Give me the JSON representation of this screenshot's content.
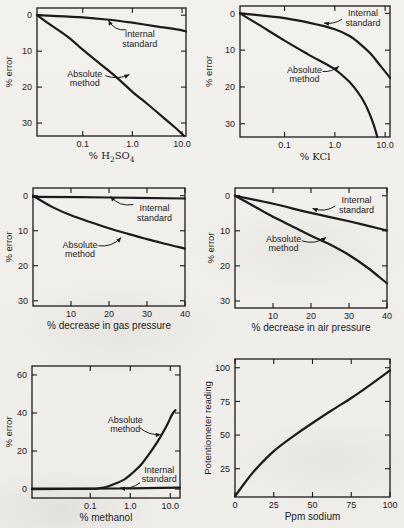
{
  "page": {
    "ink": "#1b1b1b",
    "paper": "#f1efec"
  },
  "chart_data": [
    {
      "id": "h2so4-error",
      "type": "line",
      "xscale": "log",
      "xlim": [
        0.012,
        12
      ],
      "ylim": [
        -2,
        33.6
      ],
      "y_down": true,
      "grid": false,
      "legend": "none",
      "xticks": [
        0.1,
        1.0,
        10.0
      ],
      "xtick_labels": [
        "0.1",
        "1.0",
        "10.0"
      ],
      "yticks": [
        0,
        10,
        20,
        30
      ],
      "ytick_labels": [
        "0",
        "10",
        "20",
        "30"
      ],
      "xlabel": "% H2SO4",
      "xlabel_parts": [
        [
          "% H",
          false
        ],
        [
          "2",
          true
        ],
        [
          "SO",
          false
        ],
        [
          "4",
          true
        ]
      ],
      "xlabel_serif": true,
      "ylabel": "% error",
      "box": {
        "l": 37,
        "t": 8,
        "r": 186,
        "b": 136
      },
      "ylabel_x": 12,
      "series": [
        {
          "name": "Internal standard",
          "points": [
            [
              0.012,
              0
            ],
            [
              0.03,
              0.25
            ],
            [
              0.1,
              0.6
            ],
            [
              0.3,
              1.2
            ],
            [
              1,
              2.1
            ],
            [
              3,
              3.1
            ],
            [
              10,
              4.2
            ],
            [
              12,
              4.6
            ]
          ]
        },
        {
          "name": "Absolute method",
          "points": [
            [
              0.012,
              0
            ],
            [
              0.02,
              2.2
            ],
            [
              0.05,
              6
            ],
            [
              0.1,
              9.6
            ],
            [
              0.2,
              13
            ],
            [
              0.5,
              17.5
            ],
            [
              1,
              21.3
            ],
            [
              2,
              24.7
            ],
            [
              4,
              28.2
            ],
            [
              8,
              31.8
            ],
            [
              11,
              33.6
            ]
          ]
        }
      ],
      "annotations": [
        {
          "lines": [
            "Internal",
            "standard"
          ],
          "tx": 0.69,
          "ty": 0.24,
          "sx": 0.6,
          "sy": 0.17,
          "ax": 0.48,
          "ay": 0.095,
          "bend": -0.35
        },
        {
          "lines": [
            "Absolute",
            "method"
          ],
          "tx": 0.32,
          "ty": 0.55,
          "sx": 0.46,
          "sy": 0.53,
          "ax": 0.62,
          "ay": 0.52,
          "bend": 0.2
        }
      ]
    },
    {
      "id": "kcl-error",
      "type": "line",
      "xscale": "log",
      "xlim": [
        0.013,
        12.5
      ],
      "ylim": [
        -2,
        33.6
      ],
      "y_down": true,
      "grid": false,
      "legend": "none",
      "xticks": [
        0.1,
        1.0,
        10.0
      ],
      "xtick_labels": [
        "0.1",
        "1.0",
        "10.0"
      ],
      "yticks": [
        0,
        10,
        20,
        30
      ],
      "ytick_labels": [
        "0",
        "10",
        "20",
        "30"
      ],
      "xlabel": "% KCl",
      "xlabel_parts": [
        [
          "% KCl",
          false
        ]
      ],
      "xlabel_serif": true,
      "ylabel": "% error",
      "box": {
        "l": 38,
        "t": 6,
        "r": 188,
        "b": 137
      },
      "ylabel_x": 10,
      "series": [
        {
          "name": "Internal standard",
          "points": [
            [
              0.013,
              0
            ],
            [
              0.05,
              0.8
            ],
            [
              0.1,
              1.3
            ],
            [
              0.3,
              2.5
            ],
            [
              1,
              4.3
            ],
            [
              2,
              6.2
            ],
            [
              3,
              8
            ],
            [
              5,
              10.8
            ],
            [
              8,
              14.2
            ],
            [
              12.5,
              17.5
            ]
          ]
        },
        {
          "name": "Absolute method",
          "points": [
            [
              0.013,
              0
            ],
            [
              0.03,
              3
            ],
            [
              0.1,
              7.4
            ],
            [
              0.3,
              11.2
            ],
            [
              1,
              15.2
            ],
            [
              2,
              18.8
            ],
            [
              3,
              21.8
            ],
            [
              4,
              24.6
            ],
            [
              5,
              27.6
            ],
            [
              6,
              30.5
            ],
            [
              7,
              33.6
            ]
          ]
        }
      ],
      "annotations": [
        {
          "lines": [
            "Internal",
            "standard"
          ],
          "tx": 0.82,
          "ty": 0.09,
          "sx": 0.68,
          "sy": 0.1,
          "ax": 0.56,
          "ay": 0.13,
          "bend": -0.2
        },
        {
          "lines": [
            "Absolute",
            "method"
          ],
          "tx": 0.43,
          "ty": 0.52,
          "sx": 0.55,
          "sy": 0.5,
          "ax": 0.66,
          "ay": 0.46,
          "bend": 0.2
        }
      ]
    },
    {
      "id": "gas-pressure-error",
      "type": "line",
      "xscale": "linear",
      "xlim": [
        0,
        40
      ],
      "ylim": [
        -2.2,
        31.5
      ],
      "y_down": true,
      "grid": false,
      "legend": "none",
      "xticks": [
        10,
        20,
        30,
        40
      ],
      "xtick_labels": [
        "10",
        "20",
        "30",
        "40"
      ],
      "yticks": [
        0,
        10,
        20,
        30
      ],
      "ytick_labels": [
        "0",
        "10",
        "20",
        "30"
      ],
      "xlabel": "% decrease in gas pressure",
      "xlabel_parts": [
        [
          "% decrease in gas pressure",
          false
        ]
      ],
      "xlabel_serif": false,
      "ylabel": "% error",
      "box": {
        "l": 33,
        "t": 12,
        "r": 185,
        "b": 130
      },
      "ylabel_x": 12,
      "series": [
        {
          "name": "Internal standard",
          "points": [
            [
              0,
              0.3
            ],
            [
              20,
              0.5
            ],
            [
              40,
              0.8
            ]
          ]
        },
        {
          "name": "Absolute method",
          "points": [
            [
              0,
              0
            ],
            [
              5,
              3.2
            ],
            [
              10,
              5.6
            ],
            [
              15,
              7.5
            ],
            [
              20,
              9.3
            ],
            [
              25,
              10.9
            ],
            [
              30,
              12.4
            ],
            [
              35,
              13.8
            ],
            [
              40,
              15.1
            ]
          ]
        }
      ],
      "annotations": [
        {
          "lines": [
            "Internal",
            "standard"
          ],
          "tx": 0.8,
          "ty": 0.21,
          "sx": 0.66,
          "sy": 0.14,
          "ax": 0.51,
          "ay": 0.07,
          "bend": -0.3
        },
        {
          "lines": [
            "Absolute",
            "method"
          ],
          "tx": 0.31,
          "ty": 0.52,
          "sx": 0.43,
          "sy": 0.49,
          "ax": 0.58,
          "ay": 0.42,
          "bend": 0.25
        }
      ]
    },
    {
      "id": "air-pressure-error",
      "type": "line",
      "xscale": "linear",
      "xlim": [
        0,
        40
      ],
      "ylim": [
        -2.2,
        32
      ],
      "y_down": true,
      "grid": false,
      "legend": "none",
      "xticks": [
        10,
        20,
        30,
        40
      ],
      "xtick_labels": [
        "10",
        "20",
        "30",
        "40"
      ],
      "yticks": [
        0,
        10,
        20,
        30
      ],
      "ytick_labels": [
        "0",
        "10",
        "20",
        "30"
      ],
      "xlabel": "% decrease in air pressure",
      "xlabel_parts": [
        [
          "% decrease in air pressure",
          false
        ]
      ],
      "xlabel_serif": false,
      "ylabel": "% error",
      "box": {
        "l": 33,
        "t": 12,
        "r": 185,
        "b": 132
      },
      "ylabel_x": 12,
      "series": [
        {
          "name": "Internal standard",
          "points": [
            [
              0,
              0
            ],
            [
              10,
              2.3
            ],
            [
              20,
              4.9
            ],
            [
              30,
              7.3
            ],
            [
              40,
              9.9
            ]
          ]
        },
        {
          "name": "Absolute method",
          "points": [
            [
              0,
              0
            ],
            [
              5,
              3
            ],
            [
              10,
              6
            ],
            [
              15,
              8.7
            ],
            [
              20,
              11.4
            ],
            [
              25,
              13.9
            ],
            [
              30,
              16.9
            ],
            [
              35,
              20.6
            ],
            [
              40,
              25
            ]
          ]
        }
      ],
      "annotations": [
        {
          "lines": [
            "Internal",
            "standard"
          ],
          "tx": 0.8,
          "ty": 0.14,
          "sx": 0.66,
          "sy": 0.15,
          "ax": 0.51,
          "ay": 0.17,
          "bend": -0.25
        },
        {
          "lines": [
            "Absolute",
            "method"
          ],
          "tx": 0.32,
          "ty": 0.46,
          "sx": 0.44,
          "sy": 0.44,
          "ax": 0.6,
          "ay": 0.41,
          "bend": 0.25
        }
      ]
    },
    {
      "id": "methanol-error",
      "type": "line",
      "xscale": "log",
      "xlim": [
        0.0035,
        17.5
      ],
      "ylim": [
        -4.7,
        64.7
      ],
      "y_down": false,
      "grid": false,
      "legend": "none",
      "xticks": [
        0.1,
        1.0,
        10.0
      ],
      "xtick_labels": [
        "0.1",
        "1.0",
        "10.0"
      ],
      "yticks": [
        0,
        20,
        40,
        60
      ],
      "ytick_labels": [
        "0",
        "20",
        "40",
        "60"
      ],
      "xlabel": "% methanol",
      "xlabel_parts": [
        [
          "% methanol",
          false
        ]
      ],
      "xlabel_serif": false,
      "ylabel": "% error",
      "box": {
        "l": 32,
        "t": 14,
        "r": 180,
        "b": 146
      },
      "ylabel_x": 12,
      "series": [
        {
          "name": "Internal standard",
          "points": [
            [
              0.0035,
              0.3
            ],
            [
              0.5,
              0.3
            ],
            [
              17.5,
              0.7
            ]
          ]
        },
        {
          "name": "Absolute method",
          "points": [
            [
              0.0035,
              0
            ],
            [
              0.1,
              0.1
            ],
            [
              0.15,
              0.3
            ],
            [
              0.25,
              1.1
            ],
            [
              0.4,
              2.6
            ],
            [
              0.7,
              5
            ],
            [
              1,
              7.5
            ],
            [
              1.5,
              10.8
            ],
            [
              2,
              13.6
            ],
            [
              3,
              18.6
            ],
            [
              5,
              25.5
            ],
            [
              8,
              33
            ],
            [
              11,
              39
            ],
            [
              13.5,
              41.5
            ]
          ]
        }
      ],
      "annotations": [
        {
          "lines": [
            "Absolute",
            "method"
          ],
          "tx": 0.63,
          "ty": 0.44,
          "sx": 0.73,
          "sy": 0.47,
          "ax": 0.87,
          "ay": 0.52,
          "bend": 0.2
        },
        {
          "lines": [
            "Internal",
            "standard"
          ],
          "tx": 0.86,
          "ty": 0.82,
          "sx": 0.73,
          "sy": 0.885,
          "ax": 0.595,
          "ay": 0.925,
          "bend": -0.2
        }
      ]
    },
    {
      "id": "sodium-calibration",
      "type": "line",
      "xscale": "linear",
      "xlim": [
        0,
        100
      ],
      "ylim": [
        4,
        106.5
      ],
      "y_down": false,
      "grid": false,
      "legend": "none",
      "xticks": [
        0,
        25,
        50,
        75,
        100
      ],
      "xtick_labels": [
        "0",
        "25",
        "50",
        "75",
        "100"
      ],
      "yticks": [
        25,
        50,
        75,
        100
      ],
      "ytick_labels": [
        "25",
        "50",
        "75",
        "100"
      ],
      "xlabel": "Ppm sodium",
      "xlabel_parts": [
        [
          "Ppm sodium",
          false
        ]
      ],
      "xlabel_serif": false,
      "ylabel": "Potentiometer reading",
      "box": {
        "l": 33,
        "t": 7,
        "r": 188,
        "b": 145
      },
      "ylabel_x": 9,
      "series": [
        {
          "name": "Potentiometer reading",
          "points": [
            [
              0,
              4.5
            ],
            [
              6,
              14
            ],
            [
              12.5,
              23.5
            ],
            [
              25,
              38
            ],
            [
              37.5,
              49
            ],
            [
              50,
              59
            ],
            [
              62.5,
              68.5
            ],
            [
              75,
              77.5
            ],
            [
              87.5,
              87.5
            ],
            [
              100,
              98
            ]
          ]
        }
      ],
      "annotations": []
    }
  ]
}
